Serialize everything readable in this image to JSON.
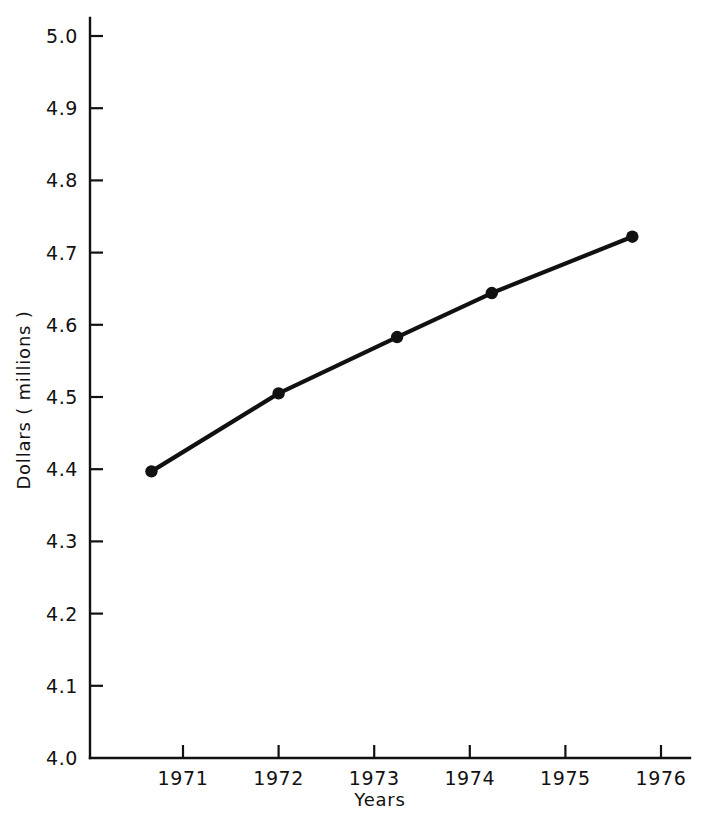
{
  "chart_data": {
    "type": "line",
    "title": "",
    "subtitle": "",
    "xlabel": "Years",
    "ylabel": "Dollars ( millions )",
    "xlim": [
      1970.33,
      1976.43
    ],
    "ylim": [
      4.0,
      5.0
    ],
    "grid": false,
    "legend": null,
    "legend_position": "none",
    "marker": "filled-circle",
    "line_color": "#111111",
    "marker_color": "#111111",
    "background_color": "#ffffff",
    "x_ticks": [
      1971,
      1972,
      1973,
      1974,
      1975,
      1976
    ],
    "x_tick_labels": [
      "1971",
      "1972",
      "1973",
      "1974",
      "1975",
      "1976"
    ],
    "y_ticks": [
      4.0,
      4.1,
      4.2,
      4.3,
      4.4,
      4.5,
      4.6,
      4.7,
      4.8,
      4.9,
      5.0
    ],
    "y_tick_labels": [
      "4.0",
      "4.1",
      "4.2",
      "4.3",
      "4.4",
      "4.5",
      "4.6",
      "4.7",
      "4.8",
      "4.9",
      "5.0"
    ],
    "series": [
      {
        "name": "Dollars",
        "x": [
          1970.67,
          1972.0,
          1973.24,
          1974.23,
          1975.7
        ],
        "values": [
          4.397,
          4.505,
          4.583,
          4.644,
          4.722
        ]
      }
    ],
    "points": [
      {
        "x": 1970.67,
        "y": 4.397
      },
      {
        "x": 1972.0,
        "y": 4.505
      },
      {
        "x": 1973.24,
        "y": 4.583
      },
      {
        "x": 1974.23,
        "y": 4.644
      },
      {
        "x": 1975.7,
        "y": 4.722
      }
    ],
    "annotations": []
  },
  "labels": {
    "xlabel": "Years",
    "ylabel": "Dollars ( millions )"
  }
}
